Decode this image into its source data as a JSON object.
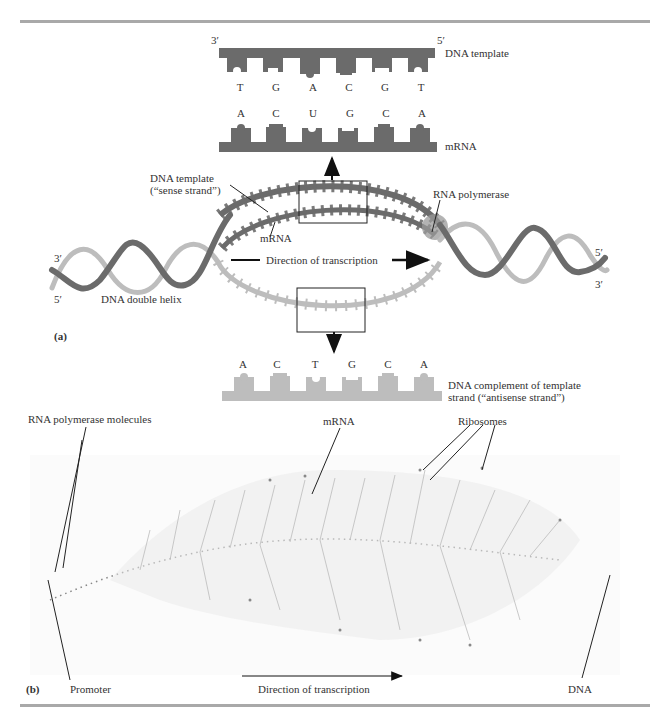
{
  "colors": {
    "dna_template": "#6b6b6b",
    "dna_complement": "#bdbdbd",
    "rna_polymerase": "#9a9a9a",
    "rule": "#a9a9a9",
    "text": "#333333"
  },
  "panel_a": {
    "label": "(a)",
    "top_inset": {
      "end_left": "3′",
      "end_right": "5′",
      "template_label": "DNA template",
      "template_bases": [
        "T",
        "G",
        "A",
        "C",
        "G",
        "T"
      ],
      "mrna_bases": [
        "A",
        "C",
        "U",
        "G",
        "C",
        "A"
      ],
      "mrna_label": "mRNA"
    },
    "bubble": {
      "template_label_line1": "DNA template",
      "template_label_line2": "(“sense strand”)",
      "mrna_label": "mRNA",
      "polymerase_label": "RNA polymerase",
      "direction_label": "Direction of transcription",
      "helix_label": "DNA double helix",
      "left_top_end": "3′",
      "left_bottom_end": "5′",
      "right_top_end": "5′",
      "right_bottom_end": "3′"
    },
    "bottom_inset": {
      "complement_bases": [
        "A",
        "C",
        "T",
        "G",
        "C",
        "A"
      ],
      "complement_label_line1": "DNA complement of template",
      "complement_label_line2": "strand (“antisense strand”)"
    }
  },
  "panel_b": {
    "label": "(b)",
    "polymerase_label": "RNA polymerase molecules",
    "mrna_label": "mRNA",
    "ribosomes_label": "Ribosomes",
    "promoter_label": "Promoter",
    "direction_label": "Direction of transcription",
    "dna_label": "DNA"
  }
}
